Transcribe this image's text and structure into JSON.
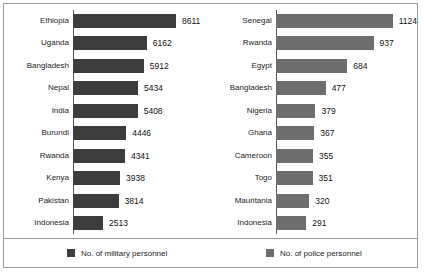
{
  "chart_data": [
    {
      "type": "bar",
      "orientation": "horizontal",
      "title": "",
      "series_name": "No. of military personnel",
      "color": "#3c3c3c",
      "xlabel": "",
      "ylabel": "",
      "grid": false,
      "axis_max": 8611,
      "categories": [
        "Ethiopia",
        "Uganda",
        "Bangladesh",
        "Nepal",
        "India",
        "Burundi",
        "Rwanda",
        "Kenya",
        "Pakistan",
        "Indonesia"
      ],
      "values": [
        8611,
        6162,
        5912,
        5434,
        5408,
        4446,
        4341,
        3938,
        3814,
        2513
      ]
    },
    {
      "type": "bar",
      "orientation": "horizontal",
      "title": "",
      "series_name": "No. of police personnel",
      "color": "#6e6e6e",
      "xlabel": "",
      "ylabel": "",
      "grid": false,
      "axis_max": 1124,
      "categories": [
        "Senegal",
        "Rwanda",
        "Egypt",
        "Bangladesh",
        "Nigeria",
        "Ghana",
        "Cameroon",
        "Togo",
        "Mauritania",
        "Indonesia"
      ],
      "values": [
        1124,
        937,
        684,
        477,
        379,
        367,
        355,
        351,
        320,
        291
      ]
    }
  ],
  "legend": {
    "position": "bottom",
    "items": [
      {
        "label": "No. of military personnel",
        "color": "#3c3c3c"
      },
      {
        "label": "No. of police personnel",
        "color": "#6e6e6e"
      }
    ]
  }
}
